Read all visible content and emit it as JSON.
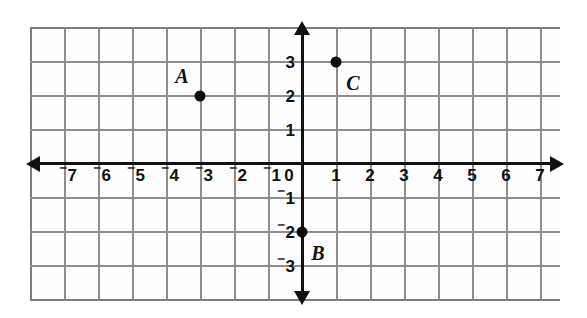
{
  "figure": {
    "background_color": "#ffffff",
    "grid_color": "#8e8e8e",
    "axis_color": "#111111",
    "point_color": "#0b0b0b"
  },
  "chart_data": {
    "type": "scatter",
    "title": "",
    "xlabel": "",
    "ylabel": "",
    "xlim": [
      -7.9,
      7.7
    ],
    "ylim": [
      -4.0,
      4.0
    ],
    "grid": true,
    "legend": null,
    "x_tick_labels": [
      "⁻7",
      "⁻6",
      "⁻5",
      "⁻4",
      "⁻3",
      "⁻2",
      "⁻1",
      "0",
      "1",
      "2",
      "3",
      "4",
      "5",
      "6",
      "7"
    ],
    "x_tick_values": [
      -7,
      -6,
      -5,
      -4,
      -3,
      -2,
      -1,
      0,
      1,
      2,
      3,
      4,
      5,
      6,
      7
    ],
    "y_tick_labels": [
      "3",
      "2",
      "1",
      "⁻1",
      "⁻2",
      "⁻3"
    ],
    "y_tick_values": [
      3,
      2,
      1,
      -1,
      -2,
      -3
    ],
    "points": [
      {
        "label": "A",
        "x": -3,
        "y": 2
      },
      {
        "label": "B",
        "x": 0,
        "y": -2
      },
      {
        "label": "C",
        "x": 1,
        "y": 3
      }
    ]
  },
  "ticks": {
    "x": [
      {
        "text_sign": "⁻",
        "text_num": "7",
        "value": -7
      },
      {
        "text_sign": "⁻",
        "text_num": "6",
        "value": -6
      },
      {
        "text_sign": "⁻",
        "text_num": "5",
        "value": -5
      },
      {
        "text_sign": "⁻",
        "text_num": "4",
        "value": -4
      },
      {
        "text_sign": "⁻",
        "text_num": "3",
        "value": -3
      },
      {
        "text_sign": "⁻",
        "text_num": "2",
        "value": -2
      },
      {
        "text_sign": "⁻",
        "text_num": "1",
        "value": -1
      },
      {
        "text_sign": "",
        "text_num": "0",
        "value": 0
      },
      {
        "text_sign": "",
        "text_num": "1",
        "value": 1
      },
      {
        "text_sign": "",
        "text_num": "2",
        "value": 2
      },
      {
        "text_sign": "",
        "text_num": "3",
        "value": 3
      },
      {
        "text_sign": "",
        "text_num": "4",
        "value": 4
      },
      {
        "text_sign": "",
        "text_num": "5",
        "value": 5
      },
      {
        "text_sign": "",
        "text_num": "6",
        "value": 6
      },
      {
        "text_sign": "",
        "text_num": "7",
        "value": 7
      }
    ],
    "y": [
      {
        "text_sign": "",
        "text_num": "3",
        "value": 3
      },
      {
        "text_sign": "",
        "text_num": "2",
        "value": 2
      },
      {
        "text_sign": "",
        "text_num": "1",
        "value": 1
      },
      {
        "text_sign": "⁻",
        "text_num": "1",
        "value": -1
      },
      {
        "text_sign": "⁻",
        "text_num": "2",
        "value": -2
      },
      {
        "text_sign": "⁻",
        "text_num": "3",
        "value": -3
      }
    ]
  },
  "points": [
    {
      "label": "A",
      "x": -3,
      "y": 2,
      "label_dx": -18,
      "label_dy": -20
    },
    {
      "label": "B",
      "x": 0,
      "y": -2,
      "label_dx": 16,
      "label_dy": 21
    },
    {
      "label": "C",
      "x": 1,
      "y": 3,
      "label_dx": 17,
      "label_dy": 21
    }
  ]
}
